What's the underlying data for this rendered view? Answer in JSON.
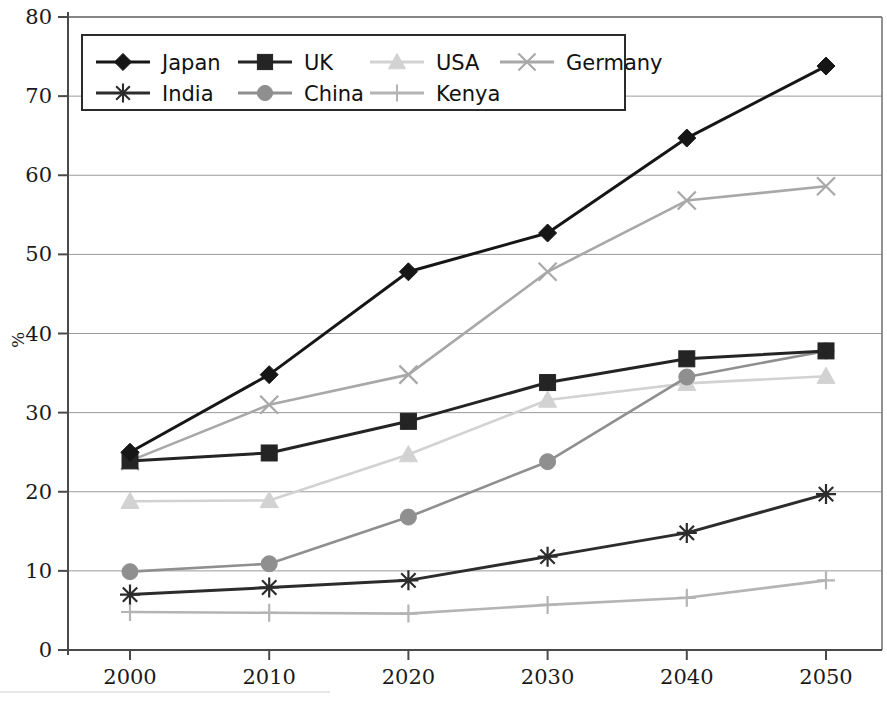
{
  "chart_data": {
    "type": "line",
    "title": "",
    "xlabel": "",
    "ylabel": "%",
    "categories": [
      "2000",
      "2010",
      "2020",
      "2030",
      "2040",
      "2050"
    ],
    "x": [
      2000,
      2010,
      2020,
      2030,
      2040,
      2050
    ],
    "xlim": [
      1995,
      2055
    ],
    "ylim": [
      0,
      80
    ],
    "y_ticks": [
      "0",
      "10",
      "20",
      "30",
      "40",
      "50",
      "60",
      "70",
      "80"
    ],
    "y_tick_values": [
      0,
      10,
      20,
      30,
      40,
      50,
      60,
      70,
      80
    ],
    "grid": true,
    "legend_position": "top-left",
    "series": [
      {
        "name": "Japan",
        "marker": "diamond",
        "color": "#161616",
        "values": [
          25.0,
          34.8,
          47.8,
          52.7,
          64.7,
          73.8
        ]
      },
      {
        "name": "UK",
        "marker": "square",
        "color": "#242424",
        "values": [
          23.9,
          24.9,
          28.9,
          33.8,
          36.8,
          37.8
        ]
      },
      {
        "name": "USA",
        "marker": "triangle",
        "color": "#d2d2d2",
        "values": [
          18.8,
          18.9,
          24.7,
          31.6,
          33.7,
          34.6
        ]
      },
      {
        "name": "Germany",
        "marker": "x",
        "color": "#a8a8a8",
        "values": [
          23.9,
          31.0,
          34.8,
          47.8,
          56.8,
          58.6
        ]
      },
      {
        "name": "India",
        "marker": "asterisk",
        "color": "#2c2c2c",
        "values": [
          7.0,
          7.9,
          8.8,
          11.8,
          14.8,
          19.7
        ]
      },
      {
        "name": "China",
        "marker": "circle",
        "color": "#8f8f8f",
        "values": [
          9.9,
          10.9,
          16.8,
          23.8,
          34.5,
          37.8
        ]
      },
      {
        "name": "Kenya",
        "marker": "plus",
        "color": "#b4b4b4",
        "values": [
          4.8,
          4.7,
          4.6,
          5.7,
          6.6,
          8.8
        ]
      }
    ]
  },
  "legend": {
    "rows": [
      [
        "Japan",
        "UK",
        "USA",
        "Germany"
      ],
      [
        "India",
        "China",
        "Kenya"
      ]
    ]
  },
  "axes": {
    "y_axis_title": "%"
  },
  "colors": {
    "background": "#ffffff",
    "gridline": "#9a9a9a",
    "axis": "#4a4a4a",
    "legend_border": "#2b2b2b",
    "text": "#111111"
  }
}
